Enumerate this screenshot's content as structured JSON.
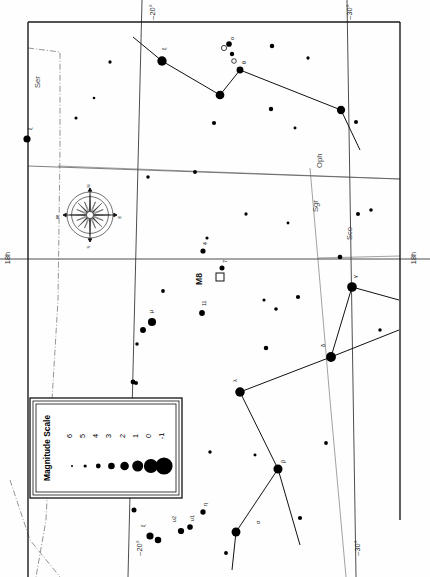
{
  "chart": {
    "type": "scatter",
    "orientation": "rotated-90",
    "projection": "equatorial",
    "frame": {
      "x": 28,
      "y": 22,
      "w": 372,
      "h": 520
    }
  },
  "legend": {
    "title": "Magnitude Scale",
    "magnitudes": [
      "6",
      "5",
      "4",
      "3",
      "2",
      "1",
      "0",
      "-1"
    ],
    "dot_radii": [
      1.0,
      1.6,
      2.4,
      3.3,
      4.3,
      5.5,
      7.0,
      8.6
    ],
    "box": {
      "x": 30,
      "y": 398,
      "w": 152,
      "h": 100
    }
  },
  "compass": {
    "labels": {
      "n": "N",
      "s": "S",
      "e": "E",
      "w": "W"
    },
    "center": {
      "x": 90,
      "y": 215
    },
    "radius": 23
  },
  "coord_labels": [
    {
      "name": "dec-top-left",
      "text": "–20°",
      "x": 155,
      "y": 12,
      "rot": -90
    },
    {
      "name": "dec-top-right",
      "text": "–30°",
      "x": 352,
      "y": 12,
      "rot": -90
    },
    {
      "name": "ra-left",
      "text": "18h",
      "x": 10,
      "y": 258,
      "rot": -90
    },
    {
      "name": "ra-right",
      "text": "18h",
      "x": 416,
      "y": 258,
      "rot": -90
    },
    {
      "name": "dec-bottom-left",
      "text": "–20°",
      "x": 142,
      "y": 548,
      "rot": -90
    },
    {
      "name": "dec-bottom-right",
      "text": "–30°",
      "x": 360,
      "y": 548,
      "rot": -90
    }
  ],
  "constellation_labels": [
    {
      "name": "Ser",
      "text": "Ser",
      "x": 40,
      "y": 88,
      "rot": -90
    },
    {
      "name": "Oph",
      "text": "Oph",
      "x": 322,
      "y": 168,
      "rot": -90
    },
    {
      "name": "Sgr",
      "text": "Sgr",
      "x": 318,
      "y": 212,
      "rot": -90
    },
    {
      "name": "Sco",
      "text": "Sco",
      "x": 352,
      "y": 240,
      "rot": -90
    }
  ],
  "deep_sky_objects": [
    {
      "name": "M8",
      "label": "M8",
      "x": 220,
      "y": 277,
      "label_x": 202,
      "label_y": 285,
      "symbol": "open-square"
    }
  ],
  "stars": [
    {
      "id": "s1",
      "x": 162,
      "y": 61,
      "mag": 1.2,
      "label": "ξ",
      "lx": 166,
      "ly": 50
    },
    {
      "id": "s2",
      "x": 220,
      "y": 95,
      "mag": 1.6,
      "label": "",
      "lx": 0,
      "ly": 0
    },
    {
      "id": "s3",
      "x": 240,
      "y": 70,
      "mag": 2.8,
      "label": "θ",
      "lx": 246,
      "ly": 64
    },
    {
      "id": "s4",
      "x": 229,
      "y": 44,
      "mag": 3.6,
      "label": "ο",
      "lx": 234,
      "ly": 40
    },
    {
      "id": "s5",
      "x": 232,
      "y": 54,
      "mag": 4.4,
      "label": "",
      "lx": 0,
      "ly": 0
    },
    {
      "id": "s6",
      "x": 341,
      "y": 110,
      "mag": 1.9,
      "label": "",
      "lx": 0,
      "ly": 0
    },
    {
      "id": "s7",
      "x": 27,
      "y": 139,
      "mag": 2.6,
      "label": "ξ",
      "lx": 32,
      "ly": 130
    },
    {
      "id": "s8",
      "x": 352,
      "y": 287,
      "mag": 1.0,
      "label": "γ",
      "lx": 357,
      "ly": 278
    },
    {
      "id": "s9",
      "x": 331,
      "y": 357,
      "mag": 0.9,
      "label": "δ",
      "lx": 325,
      "ly": 347
    },
    {
      "id": "s10",
      "x": 240,
      "y": 392,
      "mag": 1.1,
      "label": "λ",
      "lx": 237,
      "ly": 382
    },
    {
      "id": "s11",
      "x": 278,
      "y": 469,
      "mag": 1.4,
      "label": "β",
      "lx": 285,
      "ly": 463
    },
    {
      "id": "s12",
      "x": 236,
      "y": 532,
      "mag": 1.5,
      "label": "σ",
      "lx": 260,
      "ly": 524
    },
    {
      "id": "s13",
      "x": 152,
      "y": 322,
      "mag": 2.0,
      "label": "μ",
      "lx": 153,
      "ly": 313
    },
    {
      "id": "s14",
      "x": 143,
      "y": 330,
      "mag": 3.4,
      "label": "",
      "lx": 0,
      "ly": 0
    },
    {
      "id": "s15",
      "x": 202,
      "y": 313,
      "mag": 3.5,
      "label": "11",
      "lx": 206,
      "ly": 306
    },
    {
      "id": "s16",
      "x": 203,
      "y": 251,
      "mag": 3.9,
      "label": "4",
      "lx": 207,
      "ly": 245
    },
    {
      "id": "s17",
      "x": 222,
      "y": 268,
      "mag": 4.0,
      "label": "7",
      "lx": 227,
      "ly": 263
    },
    {
      "id": "s18",
      "x": 150,
      "y": 536,
      "mag": 2.6,
      "label": "ξ",
      "lx": 145,
      "ly": 527
    },
    {
      "id": "s19",
      "x": 158,
      "y": 540,
      "mag": 3.0,
      "label": "",
      "lx": 0,
      "ly": 0
    },
    {
      "id": "s20",
      "x": 181,
      "y": 531,
      "mag": 3.2,
      "label": "υ2",
      "lx": 176,
      "ly": 522
    },
    {
      "id": "s21",
      "x": 190,
      "y": 527,
      "mag": 3.6,
      "label": "υ1",
      "lx": 194,
      "ly": 521
    },
    {
      "id": "s22",
      "x": 203,
      "y": 512,
      "mag": 3.8,
      "label": "η",
      "lx": 207,
      "ly": 506
    },
    {
      "id": "s23",
      "x": 134,
      "y": 510,
      "mag": 4.0,
      "label": "",
      "lx": 0,
      "ly": 0
    },
    {
      "id": "s24",
      "x": 271,
      "y": 109,
      "mag": 4.4,
      "label": "",
      "lx": 0,
      "ly": 0
    },
    {
      "id": "s25",
      "x": 214,
      "y": 123,
      "mag": 4.5,
      "label": "",
      "lx": 0,
      "ly": 0
    },
    {
      "id": "s26",
      "x": 272,
      "y": 46,
      "mag": 4.3,
      "label": "",
      "lx": 0,
      "ly": 0
    },
    {
      "id": "s27",
      "x": 308,
      "y": 58,
      "mag": 5.1,
      "label": "",
      "lx": 0,
      "ly": 0
    },
    {
      "id": "s28",
      "x": 358,
      "y": 214,
      "mag": 4.6,
      "label": "",
      "lx": 0,
      "ly": 0
    },
    {
      "id": "s29",
      "x": 340,
      "y": 257,
      "mag": 4.2,
      "label": "",
      "lx": 0,
      "ly": 0
    },
    {
      "id": "s30",
      "x": 266,
      "y": 348,
      "mag": 4.3,
      "label": "",
      "lx": 0,
      "ly": 0
    },
    {
      "id": "s31",
      "x": 298,
      "y": 297,
      "mag": 4.5,
      "label": "",
      "lx": 0,
      "ly": 0
    },
    {
      "id": "s32",
      "x": 276,
      "y": 309,
      "mag": 4.9,
      "label": "",
      "lx": 0,
      "ly": 0
    },
    {
      "id": "s33",
      "x": 264,
      "y": 300,
      "mag": 5.2,
      "label": "",
      "lx": 0,
      "ly": 0
    },
    {
      "id": "s34",
      "x": 163,
      "y": 291,
      "mag": 4.8,
      "label": "",
      "lx": 0,
      "ly": 0
    },
    {
      "id": "s35",
      "x": 137,
      "y": 344,
      "mag": 5.0,
      "label": "",
      "lx": 0,
      "ly": 0
    },
    {
      "id": "s36",
      "x": 136,
      "y": 383,
      "mag": 4.6,
      "label": "",
      "lx": 0,
      "ly": 0
    },
    {
      "id": "s37",
      "x": 195,
      "y": 172,
      "mag": 4.7,
      "label": "",
      "lx": 0,
      "ly": 0
    },
    {
      "id": "s38",
      "x": 148,
      "y": 177,
      "mag": 5.0,
      "label": "",
      "lx": 0,
      "ly": 0
    },
    {
      "id": "s39",
      "x": 371,
      "y": 210,
      "mag": 4.9,
      "label": "",
      "lx": 0,
      "ly": 0
    },
    {
      "id": "s40",
      "x": 133,
      "y": 382,
      "mag": 4.1,
      "label": "",
      "lx": 0,
      "ly": 0
    },
    {
      "id": "s41",
      "x": 295,
      "y": 128,
      "mag": 5.3,
      "label": "",
      "lx": 0,
      "ly": 0
    },
    {
      "id": "s42",
      "x": 246,
      "y": 214,
      "mag": 5.1,
      "label": "",
      "lx": 0,
      "ly": 0
    },
    {
      "id": "s43",
      "x": 288,
      "y": 223,
      "mag": 5.4,
      "label": "",
      "lx": 0,
      "ly": 0
    },
    {
      "id": "s44",
      "x": 326,
      "y": 443,
      "mag": 4.8,
      "label": "",
      "lx": 0,
      "ly": 0
    },
    {
      "id": "s45",
      "x": 300,
      "y": 518,
      "mag": 4.5,
      "label": "",
      "lx": 0,
      "ly": 0
    },
    {
      "id": "s46",
      "x": 380,
      "y": 330,
      "mag": 5.0,
      "label": "",
      "lx": 0,
      "ly": 0
    },
    {
      "id": "s47",
      "x": 356,
      "y": 122,
      "mag": 4.6,
      "label": "",
      "lx": 0,
      "ly": 0
    },
    {
      "id": "s48",
      "x": 76,
      "y": 118,
      "mag": 5.2,
      "label": "",
      "lx": 0,
      "ly": 0
    },
    {
      "id": "s49",
      "x": 110,
      "y": 62,
      "mag": 5.1,
      "label": "",
      "lx": 0,
      "ly": 0
    },
    {
      "id": "s50",
      "x": 94,
      "y": 98,
      "mag": 5.5,
      "label": "",
      "lx": 0,
      "ly": 0
    },
    {
      "id": "s51",
      "x": 207,
      "y": 238,
      "mag": 5.2,
      "label": "",
      "lx": 0,
      "ly": 0
    },
    {
      "id": "s52",
      "x": 255,
      "y": 455,
      "mag": 5.3,
      "label": "",
      "lx": 0,
      "ly": 0
    },
    {
      "id": "s53",
      "x": 210,
      "y": 452,
      "mag": 5.0,
      "label": "",
      "lx": 0,
      "ly": 0
    },
    {
      "id": "s54",
      "x": 226,
      "y": 553,
      "mag": 4.7,
      "label": "",
      "lx": 0,
      "ly": 0
    }
  ],
  "open_stars": [
    {
      "id": "o1",
      "x": 224,
      "y": 48,
      "r": 2.6
    },
    {
      "id": "o2",
      "x": 234,
      "y": 61,
      "r": 2.3
    }
  ],
  "constellation_lines": [
    {
      "name": "teapot-lid-a",
      "x1": 133,
      "y1": 37,
      "x2": 162,
      "y2": 61
    },
    {
      "name": "teapot-lid-b",
      "x1": 162,
      "y1": 61,
      "x2": 220,
      "y2": 95
    },
    {
      "name": "teapot-lid-c",
      "x1": 220,
      "y1": 95,
      "x2": 240,
      "y2": 70
    },
    {
      "name": "teapot-lid-d",
      "x1": 240,
      "y1": 70,
      "x2": 341,
      "y2": 110
    },
    {
      "name": "teapot-lid-e",
      "x1": 341,
      "y1": 110,
      "x2": 360,
      "y2": 150
    },
    {
      "name": "sgr-gamma-delta",
      "x1": 352,
      "y1": 287,
      "x2": 331,
      "y2": 357
    },
    {
      "name": "sgr-delta-right",
      "x1": 331,
      "y1": 357,
      "x2": 399,
      "y2": 330
    },
    {
      "name": "sgr-gamma-right",
      "x1": 352,
      "y1": 287,
      "x2": 399,
      "y2": 300
    },
    {
      "name": "sgr-delta-lam",
      "x1": 331,
      "y1": 357,
      "x2": 240,
      "y2": 392
    },
    {
      "name": "sgr-lam-beta",
      "x1": 240,
      "y1": 392,
      "x2": 278,
      "y2": 469
    },
    {
      "name": "sgr-beta-sigma",
      "x1": 278,
      "y1": 469,
      "x2": 236,
      "y2": 532
    },
    {
      "name": "sgr-beta-down",
      "x1": 278,
      "y1": 469,
      "x2": 300,
      "y2": 545
    },
    {
      "name": "sgr-sigma-down",
      "x1": 236,
      "y1": 532,
      "x2": 232,
      "y2": 570
    }
  ],
  "grid": {
    "horizontal": [
      {
        "name": "ra-18h-line",
        "x1": 0,
        "y1": 259,
        "x2": 430,
        "y2": 259
      }
    ],
    "vertical": [
      {
        "name": "dec-20-line",
        "x1": 140,
        "y1": 0,
        "x2": 128,
        "y2": 577
      },
      {
        "name": "dec-30-line",
        "x1": 348,
        "y1": 0,
        "x2": 355,
        "y2": 577
      }
    ],
    "minor": [
      {
        "name": "minor-grid-a",
        "x1": 28,
        "y1": 165,
        "x2": 400,
        "y2": 178
      }
    ]
  }
}
